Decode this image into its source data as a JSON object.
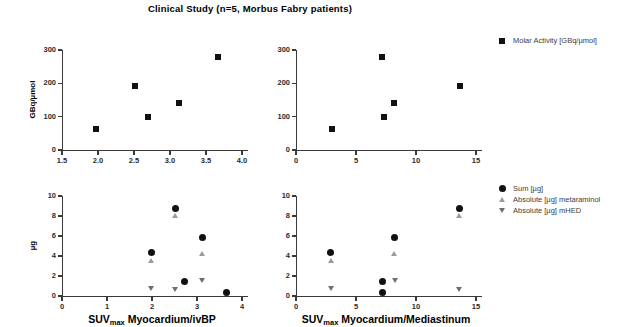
{
  "title": "Clinical Study (n=5, Morbus Fabry patients)",
  "chart_data": [
    {
      "id": "top-left",
      "type": "scatter",
      "title": "",
      "xlabel": "",
      "ylabel": "GBq/µmol",
      "xlim": [
        1.5,
        4.0
      ],
      "ylim": [
        0,
        300
      ],
      "xticks": [
        "1.5",
        "2.0",
        "2.5",
        "3.0",
        "3.5",
        "4.0"
      ],
      "xtickvals": [
        1.5,
        2.0,
        2.5,
        3.0,
        3.5,
        4.0
      ],
      "yticks": [
        "0",
        "100",
        "200",
        "300"
      ],
      "ytickvals": [
        0,
        100,
        200,
        300
      ],
      "grid": false,
      "series": [
        {
          "name": "Molar Activity [GBq/µmol]",
          "marker": "square",
          "color": "#111111",
          "points": [
            {
              "x": 1.97,
              "y": 62
            },
            {
              "x": 2.51,
              "y": 193
            },
            {
              "x": 2.7,
              "y": 100
            },
            {
              "x": 3.13,
              "y": 142
            },
            {
              "x": 3.66,
              "y": 278
            }
          ]
        }
      ]
    },
    {
      "id": "top-right",
      "type": "scatter",
      "title": "",
      "xlabel": "",
      "ylabel": "",
      "xlim": [
        0,
        15
      ],
      "ylim": [
        0,
        300
      ],
      "xticks": [
        "0",
        "5",
        "10",
        "15"
      ],
      "xtickvals": [
        0,
        5,
        10,
        15
      ],
      "yticks": [
        "0",
        "100",
        "200",
        "300"
      ],
      "ytickvals": [
        0,
        100,
        200,
        300
      ],
      "grid": false,
      "series": [
        {
          "name": "Molar Activity [GBq/µmol]",
          "marker": "square",
          "color": "#111111",
          "points": [
            {
              "x": 3.0,
              "y": 62
            },
            {
              "x": 7.2,
              "y": 278
            },
            {
              "x": 7.3,
              "y": 100
            },
            {
              "x": 8.2,
              "y": 142
            },
            {
              "x": 13.7,
              "y": 193
            }
          ]
        }
      ]
    },
    {
      "id": "bottom-left",
      "type": "scatter",
      "title": "",
      "xlabel": "SUVmax Myocardium/ivBP",
      "ylabel": "µg",
      "xlim": [
        0,
        4
      ],
      "ylim": [
        0,
        10
      ],
      "xticks": [
        "0",
        "1",
        "2",
        "3",
        "4"
      ],
      "xtickvals": [
        0,
        1,
        2,
        3,
        4
      ],
      "yticks": [
        "0",
        "2",
        "4",
        "6",
        "8",
        "10"
      ],
      "ytickvals": [
        0,
        2,
        4,
        6,
        8,
        10
      ],
      "grid": false,
      "series": [
        {
          "name": "Sum [µg]",
          "marker": "circle",
          "color": "#111111",
          "points": [
            {
              "x": 1.99,
              "y": 4.35
            },
            {
              "x": 2.52,
              "y": 8.75
            },
            {
              "x": 2.72,
              "y": 1.42
            },
            {
              "x": 3.12,
              "y": 5.9
            },
            {
              "x": 3.65,
              "y": 0.4
            }
          ]
        },
        {
          "name": "Absolute [µg] metaraminol",
          "marker": "triangle-up",
          "color": "#9a9a9a",
          "points": [
            {
              "x": 1.99,
              "y": 3.6
            },
            {
              "x": 2.52,
              "y": 8.1
            },
            {
              "x": 3.12,
              "y": 4.3
            }
          ]
        },
        {
          "name": "Absolute [µg] mHED",
          "marker": "triangle-down",
          "color": "#6e6e6e",
          "points": [
            {
              "x": 1.99,
              "y": 0.78
            },
            {
              "x": 2.52,
              "y": 0.65
            },
            {
              "x": 3.12,
              "y": 1.6
            }
          ]
        }
      ]
    },
    {
      "id": "bottom-right",
      "type": "scatter",
      "title": "",
      "xlabel": "SUVmax Myocardium/Mediastinum",
      "ylabel": "",
      "xlim": [
        0,
        15
      ],
      "ylim": [
        0,
        10
      ],
      "xticks": [
        "0",
        "5",
        "10",
        "15"
      ],
      "xtickvals": [
        0,
        5,
        10,
        15
      ],
      "yticks": [
        "0",
        "2",
        "4",
        "6",
        "8",
        "10"
      ],
      "ytickvals": [
        0,
        2,
        4,
        6,
        8,
        10
      ],
      "grid": false,
      "series": [
        {
          "name": "Sum [µg]",
          "marker": "circle",
          "color": "#111111",
          "points": [
            {
              "x": 2.9,
              "y": 4.35
            },
            {
              "x": 7.2,
              "y": 1.42
            },
            {
              "x": 7.2,
              "y": 0.4
            },
            {
              "x": 8.2,
              "y": 5.9
            },
            {
              "x": 13.6,
              "y": 8.75
            }
          ]
        },
        {
          "name": "Absolute [µg] metaraminol",
          "marker": "triangle-up",
          "color": "#9a9a9a",
          "points": [
            {
              "x": 2.9,
              "y": 3.6
            },
            {
              "x": 8.2,
              "y": 4.3
            },
            {
              "x": 13.6,
              "y": 8.1
            }
          ]
        },
        {
          "name": "Absolute [µg] mHED",
          "marker": "triangle-down",
          "color": "#6e6e6e",
          "points": [
            {
              "x": 2.9,
              "y": 0.78
            },
            {
              "x": 8.3,
              "y": 1.6
            },
            {
              "x": 13.6,
              "y": 0.65
            }
          ]
        }
      ]
    }
  ],
  "legend_top": {
    "entries": [
      {
        "label": "Molar Activity [GBq/µmol]",
        "marker": "square",
        "color": "#111111"
      }
    ]
  },
  "legend_bottom": {
    "entries": [
      {
        "label": "Sum [µg]",
        "marker": "circle",
        "color": "#111111"
      },
      {
        "label": "Absolute [µg] metaraminol",
        "marker": "triangle-up",
        "color": "#9a9a9a"
      },
      {
        "label": "Absolute  [µg] mHED",
        "marker": "triangle-down",
        "color": "#6e6e6e"
      }
    ]
  },
  "axis_labels": {
    "bottom_left_main": "Myocardium/ivBP",
    "bottom_right_main": "Myocardium/Mediastinum",
    "suv_prefix": "SUV",
    "suv_sub": "max",
    "ylabel_top": "GBq/µmol",
    "ylabel_bottom": "µg"
  }
}
